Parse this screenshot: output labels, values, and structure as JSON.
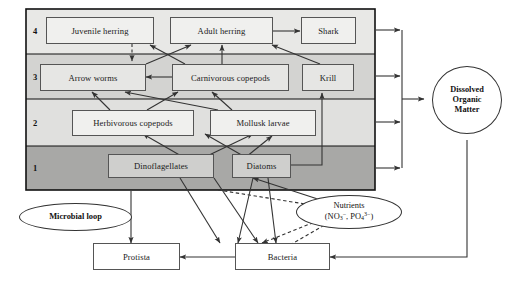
{
  "diagram": {
    "panel": {
      "levels": [
        {
          "number": "4",
          "shade": "#e8e8e6"
        },
        {
          "number": "3",
          "shade": "#d3d3d1"
        },
        {
          "number": "2",
          "shade": "#e0e0de"
        },
        {
          "number": "1",
          "shade": "#a8a8a6"
        }
      ]
    },
    "nodes": [
      {
        "id": "juvenile-herring",
        "label": "Juvenile herring",
        "level": "4",
        "fill": "#f0f0ee"
      },
      {
        "id": "adult-herring",
        "label": "Adult herring",
        "level": "4",
        "fill": "#f0f0ee"
      },
      {
        "id": "shark",
        "label": "Shark",
        "level": "4",
        "fill": "#f0f0ee"
      },
      {
        "id": "arrow-worms",
        "label": "Arrow worms",
        "level": "3",
        "fill": "#e6e6e4"
      },
      {
        "id": "carnivorous-copepods",
        "label": "Carnivorous copepods",
        "level": "3",
        "fill": "#e6e6e4"
      },
      {
        "id": "krill",
        "label": "Krill",
        "level": "3",
        "fill": "#e6e6e4"
      },
      {
        "id": "herbivorous-copepods",
        "label": "Herbivorous copepods",
        "level": "2",
        "fill": "#f0f0ee"
      },
      {
        "id": "mollusk-larvae",
        "label": "Mollusk larvae",
        "level": "2",
        "fill": "#f0f0ee"
      },
      {
        "id": "dinoflagellates",
        "label": "Dinoflagellates",
        "level": "1",
        "fill": "#cfcfcd"
      },
      {
        "id": "diatoms",
        "label": "Diatoms",
        "level": "1",
        "fill": "#cfcfcd"
      },
      {
        "id": "protista",
        "label": "Protista",
        "level": "microbial",
        "fill": "#ffffff"
      },
      {
        "id": "bacteria",
        "label": "Bacteria",
        "level": "microbial",
        "fill": "#ffffff"
      }
    ],
    "ellipses": [
      {
        "id": "microbial-loop",
        "label": "Microbial loop",
        "bold": true
      },
      {
        "id": "nutrients",
        "line1": "Nutrients",
        "line2": "(NO3-, PO43-)",
        "formula_prefix": "(NO",
        "formula_sub1": "3",
        "formula_sup1": "−",
        "formula_mid": ", PO",
        "formula_sub2": "4",
        "formula_sup2": "3−",
        "formula_suffix": ")"
      },
      {
        "id": "dissolved-organic-matter",
        "line1": "Dissolved",
        "line2": "Organic",
        "line3": "Matter"
      }
    ],
    "colors": {
      "stroke": "#333333",
      "box_border": "#555555",
      "panel_border": "#1a1a1a",
      "band_4": "#e8e8e6",
      "band_3": "#d3d3d1",
      "band_2": "#e0e0de",
      "band_1": "#a8a8a6",
      "background": "#ffffff"
    },
    "edge_styles": {
      "solid": "solid",
      "dashed": "dashed"
    }
  }
}
